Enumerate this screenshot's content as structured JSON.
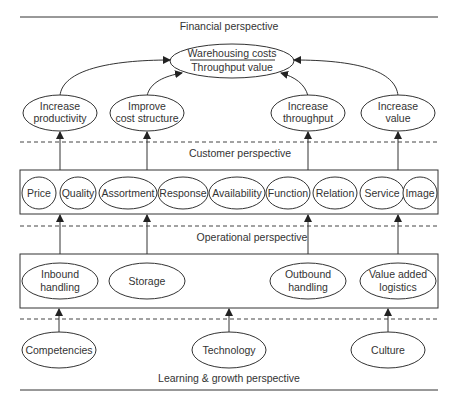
{
  "perspectives": {
    "financial": "Financial perspective",
    "customer": "Customer perspective",
    "operational": "Operational perspective",
    "learning": "Learning & growth perspective"
  },
  "financial": {
    "ratio_numerator": "Warehousing costs",
    "ratio_denominator": "Throughput value",
    "goals": [
      {
        "line1": "Increase",
        "line2": "productivity"
      },
      {
        "line1": "Improve",
        "line2": "cost structure"
      },
      {
        "line1": "Increase",
        "line2": "throughput"
      },
      {
        "line1": "Increase",
        "line2": "value"
      }
    ]
  },
  "customer": {
    "items": [
      "Price",
      "Quality",
      "Assortment",
      "Response",
      "Availability",
      "Function",
      "Relation",
      "Service",
      "Image"
    ]
  },
  "operational": {
    "items": [
      {
        "line1": "Inbound",
        "line2": "handling"
      },
      {
        "line1": "Storage",
        "line2": ""
      },
      {
        "line1": "Outbound",
        "line2": "handling"
      },
      {
        "line1": "Value added",
        "line2": "logistics"
      }
    ]
  },
  "learning": {
    "items": [
      "Competencies",
      "Technology",
      "Culture"
    ]
  }
}
